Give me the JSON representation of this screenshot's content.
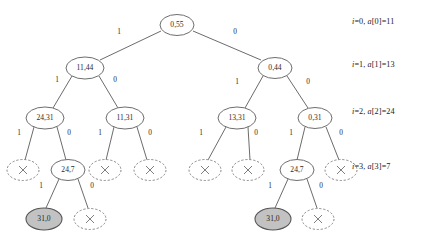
{
  "diagram": {
    "type": "tree",
    "colors": {
      "node_fill": "#ffffff",
      "node_stroke": "#6e6e6e",
      "shaded_fill": "#c2c2c2",
      "edge_stroke": "#5a5a5a",
      "text": "#2b2b2b",
      "background": "#ffffff"
    }
  },
  "row_labels": [
    {
      "id": "row-0",
      "index_part": "i=0",
      "array_part": "a[0]=11",
      "text": "i=0, a[0]=11",
      "x": 352,
      "y": 17
    },
    {
      "id": "row-1",
      "index_part": "i=1",
      "array_part": "a[1]=13",
      "text": "i=1, a[1]=13",
      "x": 352,
      "y": 60
    },
    {
      "id": "row-2",
      "index_part": "i=2",
      "array_part": "a[2]=24",
      "text": "i=2, a[2]=24",
      "x": 352,
      "y": 107
    },
    {
      "id": "row-3",
      "index_part": "i=3",
      "array_part": "a[3]=7",
      "text": "i=3, a[3]=7",
      "x": 352,
      "y": 162
    }
  ],
  "nodes": [
    {
      "id": "n-root",
      "label": "0,55",
      "x": 177,
      "y": 25,
      "rx": 17,
      "ry": 10.5,
      "style": "solid"
    },
    {
      "id": "n-l",
      "label": "11,44",
      "x": 85,
      "y": 68,
      "rx": 19,
      "ry": 11,
      "style": "solid"
    },
    {
      "id": "n-r",
      "label": "0,44",
      "x": 275,
      "y": 68,
      "rx": 17,
      "ry": 10.5,
      "style": "solid"
    },
    {
      "id": "n-ll",
      "label": "24,31",
      "x": 45,
      "y": 118,
      "rx": 19,
      "ry": 11,
      "style": "solid"
    },
    {
      "id": "n-lr",
      "label": "11,31",
      "x": 125,
      "y": 118,
      "rx": 19,
      "ry": 11,
      "style": "solid"
    },
    {
      "id": "n-rl",
      "label": "13,31",
      "x": 237,
      "y": 118,
      "rx": 19,
      "ry": 11,
      "style": "solid"
    },
    {
      "id": "n-rr",
      "label": "0,31",
      "x": 315,
      "y": 118,
      "rx": 17,
      "ry": 10.5,
      "style": "solid"
    },
    {
      "id": "n-lll",
      "label": "×",
      "x": 23,
      "y": 170,
      "rx": 16,
      "ry": 10.5,
      "style": "dashed-cross"
    },
    {
      "id": "n-llr",
      "label": "24,7",
      "x": 68,
      "y": 170,
      "rx": 17,
      "ry": 10.5,
      "style": "solid"
    },
    {
      "id": "n-lrl",
      "label": "×",
      "x": 105,
      "y": 170,
      "rx": 16,
      "ry": 10.5,
      "style": "dashed-cross"
    },
    {
      "id": "n-lrr",
      "label": "×",
      "x": 150,
      "y": 170,
      "rx": 16,
      "ry": 10.5,
      "style": "dashed-cross"
    },
    {
      "id": "n-rll",
      "label": "×",
      "x": 205,
      "y": 170,
      "rx": 16,
      "ry": 10.5,
      "style": "dashed-cross"
    },
    {
      "id": "n-rlr",
      "label": "×",
      "x": 248,
      "y": 170,
      "rx": 16,
      "ry": 10.5,
      "style": "dashed-cross"
    },
    {
      "id": "n-rrl",
      "label": "24,7",
      "x": 297,
      "y": 170,
      "rx": 17,
      "ry": 10.5,
      "style": "solid"
    },
    {
      "id": "n-rrr",
      "label": "×",
      "x": 341,
      "y": 170,
      "rx": 16,
      "ry": 10.5,
      "style": "dashed-cross"
    },
    {
      "id": "n-llrl",
      "label": "31,0",
      "x": 44,
      "y": 219,
      "rx": 18,
      "ry": 11,
      "style": "shaded"
    },
    {
      "id": "n-llrr",
      "label": "×",
      "x": 90,
      "y": 219,
      "rx": 16,
      "ry": 10.5,
      "style": "dashed-cross"
    },
    {
      "id": "n-rrll",
      "label": "31,0",
      "x": 273,
      "y": 219,
      "rx": 18,
      "ry": 11,
      "style": "shaded"
    },
    {
      "id": "n-rrlr",
      "label": "×",
      "x": 318,
      "y": 219,
      "rx": 16,
      "ry": 10.5,
      "style": "dashed-cross"
    }
  ],
  "edges": [
    {
      "id": "e-root-l",
      "from": "n-root",
      "to": "n-l",
      "x1": 161,
      "y1": 31,
      "x2": 100,
      "y2": 60,
      "label": "1",
      "lx": 119,
      "ly": 32
    },
    {
      "id": "e-root-r",
      "from": "n-root",
      "to": "n-r",
      "x1": 193,
      "y1": 31,
      "x2": 261,
      "y2": 60,
      "label": "0",
      "lx": 235,
      "ly": 32
    },
    {
      "id": "e-l-ll",
      "from": "n-l",
      "to": "n-ll",
      "x1": 72,
      "y1": 76,
      "x2": 53,
      "y2": 108,
      "label": "1",
      "lx": 57,
      "ly": 80
    },
    {
      "id": "e-l-lr",
      "from": "n-l",
      "to": "n-lr",
      "x1": 99,
      "y1": 76,
      "x2": 118,
      "y2": 108,
      "label": "0",
      "lx": 115,
      "ly": 80
    },
    {
      "id": "e-r-rl",
      "from": "n-r",
      "to": "n-rl",
      "x1": 263,
      "y1": 76,
      "x2": 245,
      "y2": 108,
      "label": "1",
      "lx": 237,
      "ly": 82
    },
    {
      "id": "e-r-rr",
      "from": "n-r",
      "to": "n-rr",
      "x1": 287,
      "y1": 76,
      "x2": 308,
      "y2": 108,
      "label": "0",
      "lx": 308,
      "ly": 82
    },
    {
      "id": "e-ll-lll",
      "from": "n-ll",
      "to": "n-lll",
      "x1": 34,
      "y1": 127,
      "x2": 25,
      "y2": 160,
      "label": "1",
      "lx": 19,
      "ly": 133
    },
    {
      "id": "e-ll-llr",
      "from": "n-ll",
      "to": "n-llr",
      "x1": 57,
      "y1": 127,
      "x2": 66,
      "y2": 160,
      "label": "0",
      "lx": 69,
      "ly": 133
    },
    {
      "id": "e-lr-lrl",
      "from": "n-lr",
      "to": "n-lrl",
      "x1": 114,
      "y1": 127,
      "x2": 106,
      "y2": 160,
      "label": "1",
      "lx": 100,
      "ly": 133
    },
    {
      "id": "e-lr-lrr",
      "from": "n-lr",
      "to": "n-lrr",
      "x1": 137,
      "y1": 127,
      "x2": 147,
      "y2": 160,
      "label": "0",
      "lx": 150,
      "ly": 133
    },
    {
      "id": "e-rl-rll",
      "from": "n-rl",
      "to": "n-rll",
      "x1": 226,
      "y1": 127,
      "x2": 208,
      "y2": 160,
      "label": "1",
      "lx": 201,
      "ly": 133
    },
    {
      "id": "e-rl-rlr",
      "from": "n-rl",
      "to": "n-rlr",
      "x1": 248,
      "y1": 127,
      "x2": 250,
      "y2": 160,
      "label": "0",
      "lx": 256,
      "ly": 133
    },
    {
      "id": "e-rr-rrl",
      "from": "n-rr",
      "to": "n-rrl",
      "x1": 305,
      "y1": 127,
      "x2": 297,
      "y2": 160,
      "label": "1",
      "lx": 291,
      "ly": 133
    },
    {
      "id": "e-rr-rrr",
      "from": "n-rr",
      "to": "n-rrr",
      "x1": 326,
      "y1": 127,
      "x2": 339,
      "y2": 160,
      "label": "0",
      "lx": 341,
      "ly": 133
    },
    {
      "id": "e-llr-llrl",
      "from": "n-llr",
      "to": "n-llrl",
      "x1": 59,
      "y1": 179,
      "x2": 46,
      "y2": 208,
      "label": "1",
      "lx": 41,
      "ly": 186
    },
    {
      "id": "e-llr-llrr",
      "from": "n-llr",
      "to": "n-llrr",
      "x1": 78,
      "y1": 179,
      "x2": 88,
      "y2": 208,
      "label": "0",
      "lx": 92,
      "ly": 186
    },
    {
      "id": "e-rrl-rrll",
      "from": "n-rrl",
      "to": "n-rrll",
      "x1": 288,
      "y1": 179,
      "x2": 275,
      "y2": 208,
      "label": "1",
      "lx": 270,
      "ly": 186
    },
    {
      "id": "e-rrl-rrlr",
      "from": "n-rrl",
      "to": "n-rrlr",
      "x1": 307,
      "y1": 179,
      "x2": 317,
      "y2": 208,
      "label": "0",
      "lx": 321,
      "ly": 186
    }
  ]
}
